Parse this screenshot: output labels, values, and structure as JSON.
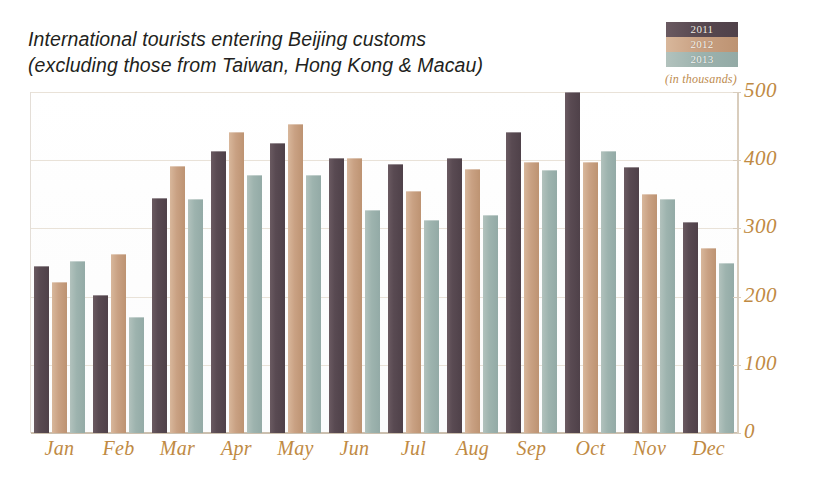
{
  "title": {
    "line1": "International tourists entering Beijing customs",
    "line2": "(excluding those from Taiwan, Hong Kong & Macau)"
  },
  "units_note": "(in thousands)",
  "legend": {
    "position": "top-right",
    "items": [
      {
        "label": "2011",
        "color": "#594a52"
      },
      {
        "label": "2012",
        "color": "#c9a183"
      },
      {
        "label": "2013",
        "color": "#9db3ae"
      }
    ]
  },
  "axis": {
    "y_ticks": [
      "0",
      "100",
      "200",
      "300",
      "400",
      "500"
    ],
    "y_min": 0,
    "y_max": 500,
    "y_step": 100
  },
  "colors": {
    "series_2011": "#594a52",
    "series_2012": "#c9a183",
    "series_2013": "#9db3ae",
    "tick_text": "#c08a43",
    "title_text": "#231f20",
    "gridline": "#e9e2d8",
    "baseline": "#cbbfae"
  },
  "chart_data": {
    "type": "bar",
    "title": "International tourists entering Beijing customs (excluding those from Taiwan, Hong Kong & Macau)",
    "subtitle": "(in thousands)",
    "xlabel": "",
    "ylabel": "",
    "ylim": [
      0,
      500
    ],
    "ytick_step": 100,
    "grid": true,
    "legend_position": "top-right",
    "categories": [
      "Jan",
      "Feb",
      "Mar",
      "Apr",
      "May",
      "Jun",
      "Jul",
      "Aug",
      "Sep",
      "Oct",
      "Nov",
      "Dec"
    ],
    "series": [
      {
        "name": "2011",
        "color": "#594a52",
        "values": [
          245,
          202,
          345,
          413,
          425,
          403,
          395,
          403,
          442,
          500,
          390,
          310
        ]
      },
      {
        "name": "2012",
        "color": "#c9a183",
        "values": [
          222,
          263,
          392,
          442,
          453,
          403,
          355,
          387,
          397,
          397,
          350,
          272
        ]
      },
      {
        "name": "2013",
        "color": "#9db3ae",
        "values": [
          252,
          170,
          343,
          378,
          378,
          327,
          312,
          320,
          385,
          413,
          343,
          250
        ]
      }
    ]
  }
}
